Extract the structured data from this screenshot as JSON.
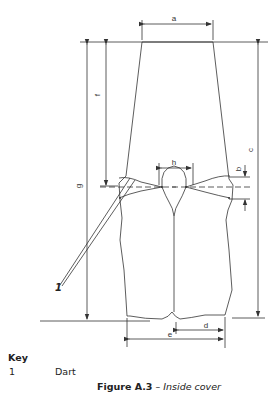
{
  "figure": {
    "number": "Figure A.3",
    "separator": " – ",
    "title": "Inside cover"
  },
  "dimensions": {
    "a": "a",
    "b": "b",
    "c": "c",
    "d": "d",
    "e": "e",
    "f": "f",
    "g": "g",
    "h": "h"
  },
  "callout": {
    "label": "1"
  },
  "key": {
    "title": "Key",
    "items": [
      {
        "number": "1",
        "label": "Dart"
      }
    ]
  },
  "colors": {
    "line": "#333333",
    "text": "#222222",
    "background": "#ffffff"
  }
}
